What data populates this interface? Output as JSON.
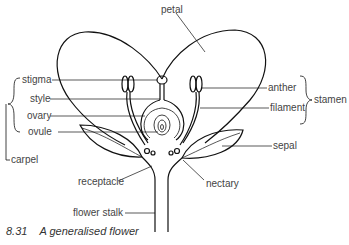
{
  "diagram": {
    "title": "A generalised flower",
    "figure_number": "8.31",
    "labels": {
      "petal": "petal",
      "stigma": "stigma",
      "style": "style",
      "ovary": "ovary",
      "ovule": "ovule",
      "carpel": "carpel",
      "anther": "anther",
      "filament": "filament",
      "stamen": "stamen",
      "sepal": "sepal",
      "receptacle": "receptacle",
      "nectary": "nectary",
      "flower_stalk": "flower stalk"
    },
    "groups": {
      "carpel": [
        "stigma",
        "style",
        "ovary",
        "ovule"
      ],
      "stamen": [
        "anther",
        "filament"
      ]
    },
    "colors": {
      "line": "#111111",
      "text": "#444444"
    }
  }
}
